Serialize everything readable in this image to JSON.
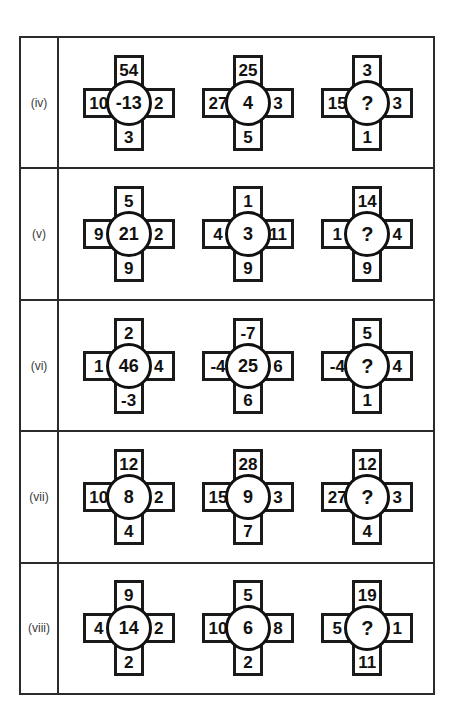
{
  "page": {
    "background_color": "#ffffff",
    "border_color": "#2b2b2b",
    "figure_color": "#1a1a1a",
    "text_color": "#111111",
    "label_color": "#3a3a3a",
    "unknown_marker": "?"
  },
  "rows": [
    {
      "label": "(iv)",
      "figures": [
        {
          "top": "54",
          "left": "10",
          "centre": "-13",
          "right": "2",
          "bottom": "3"
        },
        {
          "top": "25",
          "left": "27",
          "centre": "4",
          "right": "3",
          "bottom": "5"
        },
        {
          "top": "3",
          "left": "15",
          "centre": "?",
          "right": "3",
          "bottom": "1"
        }
      ]
    },
    {
      "label": "(v)",
      "figures": [
        {
          "top": "5",
          "left": "9",
          "centre": "21",
          "right": "2",
          "bottom": "9"
        },
        {
          "top": "1",
          "left": "4",
          "centre": "3",
          "right": "11",
          "bottom": "9"
        },
        {
          "top": "14",
          "left": "1",
          "centre": "?",
          "right": "4",
          "bottom": "9"
        }
      ]
    },
    {
      "label": "(vi)",
      "figures": [
        {
          "top": "2",
          "left": "1",
          "centre": "46",
          "right": "4",
          "bottom": "-3"
        },
        {
          "top": "-7",
          "left": "-4",
          "centre": "25",
          "right": "6",
          "bottom": "6"
        },
        {
          "top": "5",
          "left": "-4",
          "centre": "?",
          "right": "4",
          "bottom": "1"
        }
      ]
    },
    {
      "label": "(vii)",
      "figures": [
        {
          "top": "12",
          "left": "10",
          "centre": "8",
          "right": "2",
          "bottom": "4"
        },
        {
          "top": "28",
          "left": "15",
          "centre": "9",
          "right": "3",
          "bottom": "7"
        },
        {
          "top": "12",
          "left": "27",
          "centre": "?",
          "right": "3",
          "bottom": "4"
        }
      ]
    },
    {
      "label": "(viii)",
      "figures": [
        {
          "top": "9",
          "left": "4",
          "centre": "14",
          "right": "2",
          "bottom": "2"
        },
        {
          "top": "5",
          "left": "10",
          "centre": "6",
          "right": "8",
          "bottom": "2"
        },
        {
          "top": "19",
          "left": "5",
          "centre": "?",
          "right": "1",
          "bottom": "11"
        }
      ]
    }
  ]
}
